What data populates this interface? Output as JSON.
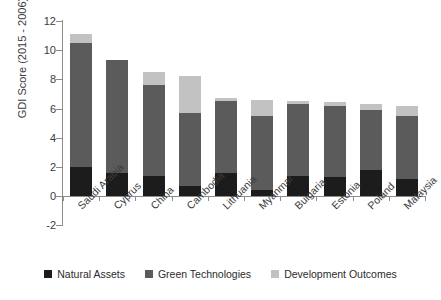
{
  "chart_data": {
    "type": "bar",
    "subtype": "stacked-vertical",
    "title": "",
    "xlabel": "",
    "ylabel": "GDI Score (2015 - 2006)",
    "ylim": [
      -2,
      12
    ],
    "yticks": [
      -2,
      0,
      2,
      4,
      6,
      8,
      10,
      12
    ],
    "ytick_labels": [
      "-2",
      "0",
      "2",
      "4",
      "6",
      "8",
      "10",
      "12"
    ],
    "grid": false,
    "legend_position": "bottom",
    "categories": [
      "Saudi Arabia",
      "Cyprus",
      "China",
      "Cambodia",
      "Lithuania",
      "Myanmar",
      "Bulgaria",
      "Estonia",
      "Poland",
      "Malaysia"
    ],
    "series": [
      {
        "name": "Natural Assets",
        "color": "#1c1c1c",
        "values": [
          2.0,
          1.6,
          1.4,
          0.7,
          1.6,
          0.4,
          1.4,
          1.3,
          1.8,
          1.2
        ]
      },
      {
        "name": "Green Technologies",
        "color": "#5b5b5b",
        "values": [
          8.5,
          7.7,
          6.2,
          5.0,
          4.9,
          5.1,
          4.9,
          4.9,
          4.1,
          4.3
        ]
      },
      {
        "name": "Development Outcomes",
        "color": "#c2c2c2",
        "values": [
          0.6,
          0.05,
          0.9,
          2.5,
          0.2,
          1.1,
          0.2,
          0.25,
          0.4,
          0.7
        ]
      }
    ],
    "totals": [
      11.1,
      9.35,
      8.5,
      8.2,
      6.7,
      6.6,
      6.5,
      6.45,
      6.3,
      6.2
    ]
  },
  "legend": {
    "items": [
      {
        "label": "Natural Assets"
      },
      {
        "label": "Green Technologies"
      },
      {
        "label": "Development Outcomes"
      }
    ]
  },
  "axis": {
    "y_title": "GDI Score (2015 - 2006)"
  }
}
